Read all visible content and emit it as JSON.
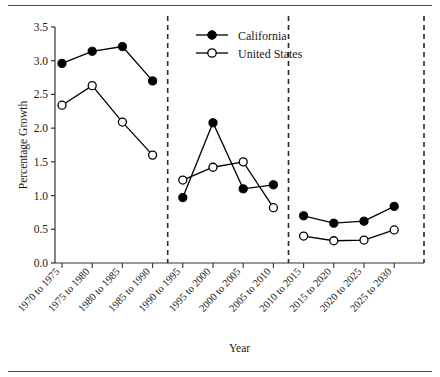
{
  "chart_data": {
    "type": "line",
    "title": "",
    "xlabel": "Year",
    "ylabel": "Percentage Growth",
    "ylim": [
      0.0,
      3.5
    ],
    "ytick_labels": [
      "0.0",
      "0.5",
      "1.0",
      "1.5",
      "2.0",
      "2.5",
      "3.0",
      "3.5"
    ],
    "ytick_values": [
      0.0,
      0.5,
      1.0,
      1.5,
      2.0,
      2.5,
      3.0,
      3.5
    ],
    "grid": false,
    "legend_position": "top-center",
    "categories": [
      "1970 to 1975",
      "1975 to 1980",
      "1980 to 1985",
      "1985 to 1990",
      "1990 to 1995",
      "1995 to 2000",
      "2000 to 2005",
      "2005 to 2010",
      "2010 to 2015",
      "2015 to 2020",
      "2020 to 2025",
      "2025 to 2030"
    ],
    "series": [
      {
        "name": "California",
        "marker": "filled-circle",
        "color": "#000000",
        "values": [
          2.96,
          3.14,
          3.21,
          2.7,
          0.97,
          2.08,
          1.1,
          1.16,
          0.7,
          0.59,
          0.62,
          0.84
        ]
      },
      {
        "name": "United States",
        "marker": "open-circle",
        "color": "#000000",
        "values": [
          2.34,
          2.63,
          2.09,
          1.6,
          1.23,
          1.42,
          1.5,
          0.82,
          0.4,
          0.33,
          0.34,
          0.49
        ]
      }
    ],
    "segment_dividers": [
      "after 1985 to 1990",
      "after 2005 to 2010"
    ],
    "annotations": []
  },
  "legend": {
    "items": [
      {
        "label": "California",
        "marker": "filled-circle"
      },
      {
        "label": "United States",
        "marker": "open-circle"
      }
    ]
  },
  "axes": {
    "y_title": "Percentage Growth",
    "x_title": "Year"
  }
}
